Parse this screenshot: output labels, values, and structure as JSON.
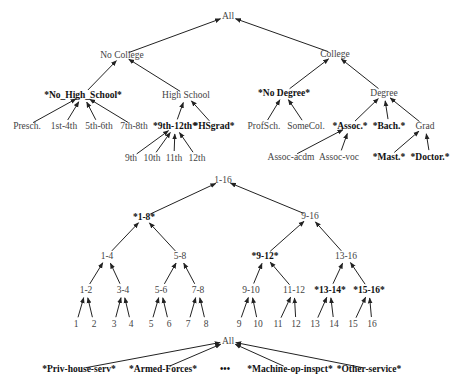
{
  "diagrams": [
    {
      "id": "education",
      "title": "Education hierarchy",
      "nodes": [
        {
          "id": "all",
          "label": "All",
          "x": 228,
          "y": 16,
          "bold": false
        },
        {
          "id": "nocollege",
          "label": "No  College",
          "x": 122,
          "y": 55,
          "bold": false
        },
        {
          "id": "college",
          "label": "College",
          "x": 335,
          "y": 54,
          "bold": false
        },
        {
          "id": "nohs",
          "label": "*No_High_School*",
          "x": 83,
          "y": 95,
          "bold": true
        },
        {
          "id": "hs",
          "label": "High  School",
          "x": 186,
          "y": 95,
          "bold": false
        },
        {
          "id": "nodeg",
          "label": "*No  Degree*",
          "x": 284,
          "y": 93,
          "bold": true
        },
        {
          "id": "degree",
          "label": "Degree",
          "x": 384,
          "y": 93,
          "bold": false
        },
        {
          "id": "presch",
          "label": "Presch.",
          "x": 27,
          "y": 126,
          "bold": false
        },
        {
          "id": "1st4th",
          "label": "1st-4th",
          "x": 64,
          "y": 126,
          "bold": false
        },
        {
          "id": "5th6th",
          "label": "5th-6th",
          "x": 99,
          "y": 126,
          "bold": false
        },
        {
          "id": "7th8th",
          "label": "7th-8th",
          "x": 134,
          "y": 126,
          "bold": false
        },
        {
          "id": "9th12th",
          "label": "*9th-12th*",
          "x": 175,
          "y": 126,
          "bold": true
        },
        {
          "id": "hsgrad",
          "label": "*HSgrad*",
          "x": 214,
          "y": 126,
          "bold": true
        },
        {
          "id": "profsch",
          "label": "ProfSch.",
          "x": 264,
          "y": 126,
          "bold": false
        },
        {
          "id": "somecol",
          "label": "SomeCol.",
          "x": 306,
          "y": 126,
          "bold": false
        },
        {
          "id": "assoc",
          "label": "*Assoc.*",
          "x": 350,
          "y": 126,
          "bold": true
        },
        {
          "id": "bach",
          "label": "*Bach.*",
          "x": 389,
          "y": 126,
          "bold": true
        },
        {
          "id": "grad",
          "label": "Grad",
          "x": 425,
          "y": 126,
          "bold": false
        },
        {
          "id": "9th",
          "label": "9th",
          "x": 131,
          "y": 158,
          "bold": false
        },
        {
          "id": "10th",
          "label": "10th",
          "x": 152,
          "y": 158,
          "bold": false
        },
        {
          "id": "11th",
          "label": "11th",
          "x": 174,
          "y": 158,
          "bold": false
        },
        {
          "id": "12th",
          "label": "12th",
          "x": 197,
          "y": 158,
          "bold": false
        },
        {
          "id": "assocacdm",
          "label": "Assoc-acdm",
          "x": 291,
          "y": 157,
          "bold": false
        },
        {
          "id": "assocvoc",
          "label": "Assoc-voc",
          "x": 339,
          "y": 157,
          "bold": false
        },
        {
          "id": "mast",
          "label": "*Mast.*",
          "x": 389,
          "y": 157,
          "bold": true
        },
        {
          "id": "doctor",
          "label": "*Doctor.*",
          "x": 430,
          "y": 157,
          "bold": true
        }
      ],
      "edges": [
        [
          "nocollege",
          "all"
        ],
        [
          "college",
          "all"
        ],
        [
          "nohs",
          "nocollege"
        ],
        [
          "hs",
          "nocollege"
        ],
        [
          "nodeg",
          "college"
        ],
        [
          "degree",
          "college"
        ],
        [
          "presch",
          "nohs"
        ],
        [
          "1st4th",
          "nohs"
        ],
        [
          "5th6th",
          "nohs"
        ],
        [
          "7th8th",
          "nohs"
        ],
        [
          "9th12th",
          "hs"
        ],
        [
          "hsgrad",
          "hs"
        ],
        [
          "profsch",
          "nodeg"
        ],
        [
          "somecol",
          "nodeg"
        ],
        [
          "assoc",
          "degree"
        ],
        [
          "bach",
          "degree"
        ],
        [
          "grad",
          "degree"
        ],
        [
          "9th",
          "9th12th"
        ],
        [
          "10th",
          "9th12th"
        ],
        [
          "11th",
          "9th12th"
        ],
        [
          "12th",
          "9th12th"
        ],
        [
          "assocacdm",
          "assoc"
        ],
        [
          "assocvoc",
          "assoc"
        ],
        [
          "mast",
          "grad"
        ],
        [
          "doctor",
          "grad"
        ]
      ]
    },
    {
      "id": "numeric",
      "title": "Numeric range hierarchy 1-16",
      "nodes": [
        {
          "id": "r1_16",
          "label": "1-16",
          "x": 223,
          "y": 180,
          "bold": false
        },
        {
          "id": "r1_8",
          "label": "*1-8*",
          "x": 144,
          "y": 217,
          "bold": true
        },
        {
          "id": "r9_16",
          "label": "9-16",
          "x": 310,
          "y": 216,
          "bold": false
        },
        {
          "id": "r1_4",
          "label": "1-4",
          "x": 107,
          "y": 256,
          "bold": false
        },
        {
          "id": "r5_8",
          "label": "5-8",
          "x": 180,
          "y": 256,
          "bold": false
        },
        {
          "id": "r9_12",
          "label": "*9-12*",
          "x": 265,
          "y": 256,
          "bold": true
        },
        {
          "id": "r13_16",
          "label": "13-16",
          "x": 346,
          "y": 256,
          "bold": false
        },
        {
          "id": "r1_2",
          "label": "1-2",
          "x": 86,
          "y": 290,
          "bold": false
        },
        {
          "id": "r3_4",
          "label": "3-4",
          "x": 123,
          "y": 290,
          "bold": false
        },
        {
          "id": "r5_6",
          "label": "5-6",
          "x": 161,
          "y": 290,
          "bold": false
        },
        {
          "id": "r7_8",
          "label": "7-8",
          "x": 198,
          "y": 290,
          "bold": false
        },
        {
          "id": "r9_10",
          "label": "9-10",
          "x": 251,
          "y": 290,
          "bold": false
        },
        {
          "id": "r11_12",
          "label": "11-12",
          "x": 294,
          "y": 290,
          "bold": false
        },
        {
          "id": "r13_14",
          "label": "*13-14*",
          "x": 330,
          "y": 290,
          "bold": true
        },
        {
          "id": "r15_16",
          "label": "*15-16*",
          "x": 369,
          "y": 290,
          "bold": true
        },
        {
          "id": "n1",
          "label": "1",
          "x": 76,
          "y": 324,
          "bold": false
        },
        {
          "id": "n2",
          "label": "2",
          "x": 94,
          "y": 324,
          "bold": false
        },
        {
          "id": "n3",
          "label": "3",
          "x": 114,
          "y": 324,
          "bold": false
        },
        {
          "id": "n4",
          "label": "4",
          "x": 131,
          "y": 324,
          "bold": false
        },
        {
          "id": "n5",
          "label": "5",
          "x": 151,
          "y": 324,
          "bold": false
        },
        {
          "id": "n6",
          "label": "6",
          "x": 169,
          "y": 324,
          "bold": false
        },
        {
          "id": "n7",
          "label": "7",
          "x": 188,
          "y": 324,
          "bold": false
        },
        {
          "id": "n8",
          "label": "8",
          "x": 206,
          "y": 324,
          "bold": false
        },
        {
          "id": "n9",
          "label": "9",
          "x": 239,
          "y": 324,
          "bold": false
        },
        {
          "id": "n10",
          "label": "10",
          "x": 258,
          "y": 324,
          "bold": false
        },
        {
          "id": "n11",
          "label": "11",
          "x": 278,
          "y": 324,
          "bold": false
        },
        {
          "id": "n12",
          "label": "12",
          "x": 296,
          "y": 324,
          "bold": false
        },
        {
          "id": "n13",
          "label": "13",
          "x": 315,
          "y": 324,
          "bold": false
        },
        {
          "id": "n14",
          "label": "14",
          "x": 334,
          "y": 324,
          "bold": false
        },
        {
          "id": "n15",
          "label": "15",
          "x": 353,
          "y": 324,
          "bold": false
        },
        {
          "id": "n16",
          "label": "16",
          "x": 372,
          "y": 324,
          "bold": false
        }
      ],
      "edges": [
        [
          "r1_8",
          "r1_16"
        ],
        [
          "r9_16",
          "r1_16"
        ],
        [
          "r1_4",
          "r1_8"
        ],
        [
          "r5_8",
          "r1_8"
        ],
        [
          "r9_12",
          "r9_16"
        ],
        [
          "r13_16",
          "r9_16"
        ],
        [
          "r1_2",
          "r1_4"
        ],
        [
          "r3_4",
          "r1_4"
        ],
        [
          "r5_6",
          "r5_8"
        ],
        [
          "r7_8",
          "r5_8"
        ],
        [
          "r9_10",
          "r9_12"
        ],
        [
          "r11_12",
          "r9_12"
        ],
        [
          "r13_14",
          "r13_16"
        ],
        [
          "r15_16",
          "r13_16"
        ],
        [
          "n1",
          "r1_2"
        ],
        [
          "n2",
          "r1_2"
        ],
        [
          "n3",
          "r3_4"
        ],
        [
          "n4",
          "r3_4"
        ],
        [
          "n5",
          "r5_6"
        ],
        [
          "n6",
          "r5_6"
        ],
        [
          "n7",
          "r7_8"
        ],
        [
          "n8",
          "r7_8"
        ],
        [
          "n9",
          "r9_10"
        ],
        [
          "n10",
          "r9_10"
        ],
        [
          "n11",
          "r11_12"
        ],
        [
          "n12",
          "r11_12"
        ],
        [
          "n13",
          "r13_14"
        ],
        [
          "n14",
          "r13_14"
        ],
        [
          "n15",
          "r15_16"
        ],
        [
          "n16",
          "r15_16"
        ]
      ]
    },
    {
      "id": "occupation",
      "title": "Occupation hierarchy",
      "nodes": [
        {
          "id": "occ_all",
          "label": "All",
          "x": 228,
          "y": 341,
          "bold": false
        },
        {
          "id": "privhouse",
          "label": "*Priv-house-serv*",
          "x": 79,
          "y": 369,
          "bold": true
        },
        {
          "id": "armed",
          "label": "*Armed-Forces*",
          "x": 163,
          "y": 369,
          "bold": true
        },
        {
          "id": "ellipsis",
          "label": "•••",
          "x": 225,
          "y": 369,
          "bold": true
        },
        {
          "id": "machine",
          "label": "*Machine-op-inspct*",
          "x": 290,
          "y": 369,
          "bold": true
        },
        {
          "id": "other",
          "label": "*Other-service*",
          "x": 369,
          "y": 369,
          "bold": true
        }
      ],
      "edges": [
        [
          "privhouse",
          "occ_all"
        ],
        [
          "armed",
          "occ_all"
        ],
        [
          "machine",
          "occ_all"
        ],
        [
          "other",
          "occ_all"
        ]
      ]
    }
  ],
  "colors": {
    "edge": "#222222",
    "label": "#444444",
    "bold_label": "#111111",
    "background": "#ffffff"
  }
}
